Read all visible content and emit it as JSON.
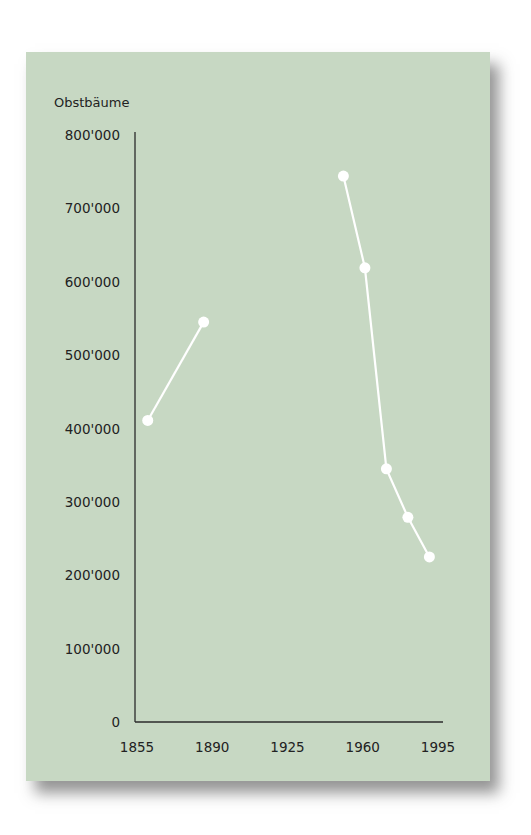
{
  "colors": {
    "panel": "#c7d8c3",
    "line": "#ffffff",
    "axis": "#2b2b2b",
    "text": "#222222"
  },
  "chart_data": {
    "type": "line",
    "title": "Obstbäume",
    "xlabel": "",
    "ylabel": "Obstbäume",
    "xlim": [
      1855,
      1995
    ],
    "ylim": [
      0,
      800000
    ],
    "grid": false,
    "legend": null,
    "x_ticks": [
      1855,
      1890,
      1925,
      1960,
      1995
    ],
    "x_tick_labels": [
      "1855",
      "1890",
      "1925",
      "1960",
      "1995"
    ],
    "y_ticks": [
      0,
      100000,
      200000,
      300000,
      400000,
      500000,
      600000,
      700000,
      800000
    ],
    "y_tick_labels": [
      "0",
      "100'000",
      "200'000",
      "300'000",
      "400'000",
      "500'000",
      "600'000",
      "700'000",
      "800'000"
    ],
    "series": [
      {
        "name": "Obstbäume 19. Jh.",
        "x": [
          1860,
          1886
        ],
        "values": [
          411000,
          545000
        ]
      },
      {
        "name": "Obstbäume 20. Jh.",
        "x": [
          1951,
          1961,
          1971,
          1981,
          1991
        ],
        "values": [
          744000,
          619000,
          345000,
          279000,
          225000
        ]
      }
    ]
  }
}
